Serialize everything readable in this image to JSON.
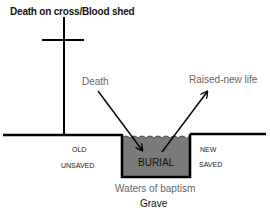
{
  "diagram": {
    "title": "Death on cross/Blood shed",
    "labels": {
      "death": "Death",
      "raised": "Raised-new life",
      "old": "OLD",
      "unsaved": "UNSAVED",
      "new": "NEW",
      "saved": "SAVED",
      "burial": "BURIAL",
      "waters": "Waters of baptism",
      "grave": "Grave"
    },
    "colors": {
      "line": "#000000",
      "grave_fill": "#7a7a7a",
      "muted_text": "#666666"
    }
  }
}
